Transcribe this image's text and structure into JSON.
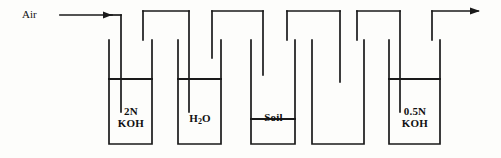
{
  "diagram": {
    "stroke_color": "#1a1a1a",
    "background_color": "#fdfdfb",
    "inlet": {
      "label": "Air",
      "arrow_icon": "arrow-right-icon"
    },
    "outlet": {
      "label": "",
      "arrow_icon": "arrow-right-icon"
    },
    "vessels": [
      {
        "id": "vessel-1",
        "label_line1": "2N",
        "label_line2": "KOH",
        "contents": "2N KOH",
        "filled": true
      },
      {
        "id": "vessel-2",
        "label_line1": "H",
        "label_sub": "2",
        "label_line1_tail": "O",
        "label_line2": "",
        "contents": "H2O",
        "filled": true
      },
      {
        "id": "vessel-3",
        "label_line1": "Soil",
        "label_line2": "",
        "contents": "Soil",
        "filled": true
      },
      {
        "id": "vessel-4",
        "label_line1": "",
        "label_line2": "",
        "contents": "",
        "filled": false
      },
      {
        "id": "vessel-5",
        "label_line1": "0.5N",
        "label_line2": "KOH",
        "contents": "0.5N KOH",
        "filled": true
      }
    ]
  }
}
